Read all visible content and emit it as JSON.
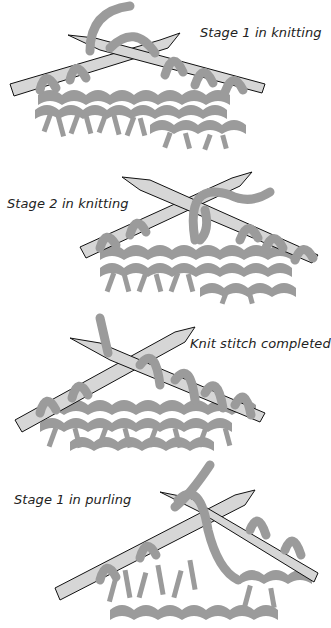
{
  "figure": {
    "top_text_cutoff": "... purling ...",
    "colors": {
      "background": "#ffffff",
      "yarn": "#9b9b9b",
      "needle_fill": "#d6d6d6",
      "needle_outline": "#111111",
      "caption_text": "#222222"
    },
    "panels": [
      {
        "id": "stage-1-knitting",
        "caption": "Stage 1 in knitting"
      },
      {
        "id": "stage-2-knitting",
        "caption": "Stage 2 in knitting"
      },
      {
        "id": "knit-stitch-completed",
        "caption": "Knit stitch completed"
      },
      {
        "id": "stage-1-purling",
        "caption": "Stage 1 in purling"
      }
    ]
  }
}
